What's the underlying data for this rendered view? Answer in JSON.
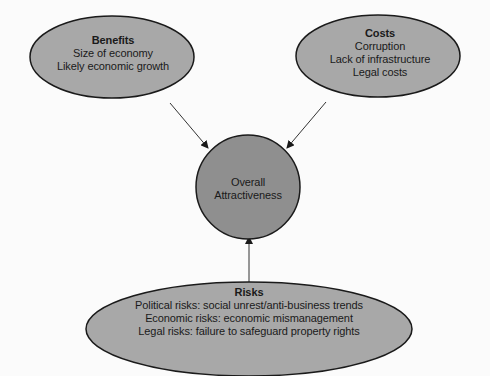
{
  "diagram": {
    "colors": {
      "node_fill": "#a8a8a8",
      "center_fill": "#8f8f8f",
      "stroke": "#1a1a1a",
      "background": "#fbfbfb"
    },
    "nodes": {
      "benefits": {
        "title": "Benefits",
        "lines": [
          "Size of economy",
          "Likely economic growth"
        ]
      },
      "costs": {
        "title": "Costs",
        "lines": [
          "Corruption",
          "Lack of infrastructure",
          "Legal costs"
        ]
      },
      "center": {
        "lines": [
          "Overall",
          "Attractiveness"
        ]
      },
      "risks": {
        "title": "Risks",
        "lines": [
          "Political risks: social unrest/anti-business trends",
          "Economic risks: economic mismanagement",
          "Legal risks: failure to safeguard property rights"
        ]
      }
    },
    "edges": [
      {
        "from": "benefits",
        "to": "center"
      },
      {
        "from": "costs",
        "to": "center"
      },
      {
        "from": "risks",
        "to": "center"
      }
    ]
  }
}
